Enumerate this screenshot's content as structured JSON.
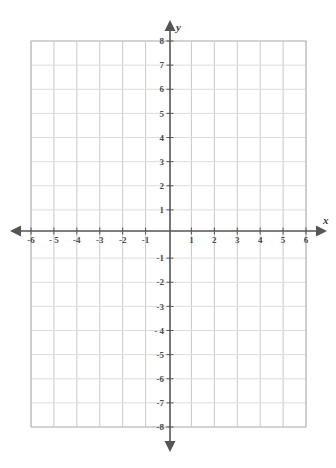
{
  "chart_data": {
    "type": "scatter",
    "title": "",
    "subtitle": "",
    "xlabel": "x",
    "ylabel": "y",
    "xlim": [
      -6,
      6
    ],
    "ylim": [
      -8,
      8
    ],
    "x_tick_step": 1,
    "y_tick_step": 1,
    "grid": true,
    "legend": "none",
    "series": [],
    "x_tick_labels": [
      "-6",
      "- 5",
      "-4",
      "-3",
      "-2",
      "-1",
      "1",
      "2",
      "3",
      "4",
      "5",
      "6"
    ],
    "x_tick_values": [
      -6,
      -5,
      -4,
      -3,
      -2,
      -1,
      1,
      2,
      3,
      4,
      5,
      6
    ],
    "y_tick_labels": [
      "8",
      "7",
      "6",
      "5",
      "4",
      "3",
      "2",
      "1",
      "-1",
      "-2",
      "-3",
      "- 4",
      "-5",
      "-6",
      "-7",
      "-8"
    ],
    "y_tick_values": [
      8,
      7,
      6,
      5,
      4,
      3,
      2,
      1,
      -1,
      -2,
      -3,
      -4,
      -5,
      -6,
      -7,
      -8
    ],
    "origin_label": "",
    "annotations": []
  },
  "graph": {
    "axis_labels": {
      "x": "x",
      "y": "y"
    },
    "colors": {
      "background": "#ffffff",
      "grid_line": "#c9c9c9",
      "grid_line_light": "#dcdcdc",
      "axis_line": "#555555",
      "tick_text": "#4a4a4a",
      "border": "#b8b8b8"
    },
    "geometry": {
      "plot_left": 31,
      "plot_right": 306,
      "plot_top": 41,
      "plot_bottom": 427,
      "origin_x": 170,
      "origin_y": 231,
      "cell_width": 22.9,
      "cell_height": 24.1
    }
  }
}
